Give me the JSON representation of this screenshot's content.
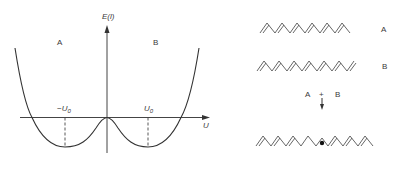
{
  "figure": {
    "left_panel": {
      "y_axis_label": "E(l)",
      "x_axis_label": "U",
      "region_labels": [
        "A",
        "B"
      ],
      "tick_labels": {
        "left": "−U",
        "right": "U",
        "subscript": "0"
      },
      "curve": "double-well potential with minima at -U0 and U0"
    },
    "right_panel": {
      "chain_a_label": "A",
      "chain_b_label": "B",
      "combine_left": "A",
      "combine_plus": "+",
      "combine_right": "B",
      "result": "chain with soliton defect (dot)"
    }
  },
  "colors": {
    "ink": "#3a3a3a",
    "background": "#ffffff"
  }
}
